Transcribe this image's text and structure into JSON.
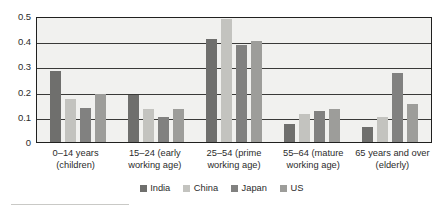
{
  "chart_data": {
    "type": "bar",
    "title": "",
    "xlabel": "",
    "ylabel": "",
    "ylim": [
      0,
      0.5
    ],
    "grid": true,
    "legend_position": "bottom",
    "categories": [
      "0–14 years (children)",
      "15–24 (early working age)",
      "25–54 (prime working age)",
      "55–64 (mature working age)",
      "65 years and over (elderly)"
    ],
    "category_lines": [
      [
        "0–14 years",
        "(children)"
      ],
      [
        "15–24 (early",
        "working age)"
      ],
      [
        "25–54 (prime",
        "working age)"
      ],
      [
        "55–64 (mature",
        "working age)"
      ],
      [
        "65 years and over",
        "(elderly)"
      ]
    ],
    "ytick_labels": [
      "0.5",
      "0.4",
      "0.3",
      "0.2",
      "0.1",
      "0"
    ],
    "ytick_values": [
      0.5,
      0.4,
      0.3,
      0.2,
      0.1,
      0
    ],
    "series": [
      {
        "name": "India",
        "color": "#6f6f6d",
        "values": [
          0.28,
          0.185,
          0.41,
          0.07,
          0.058
        ]
      },
      {
        "name": "China",
        "color": "#c3c3bf",
        "values": [
          0.17,
          0.131,
          0.49,
          0.11,
          0.1
        ]
      },
      {
        "name": "Japan",
        "color": "#818180",
        "values": [
          0.134,
          0.1,
          0.384,
          0.123,
          0.275
        ]
      },
      {
        "name": "US",
        "color": "#9d9d9a",
        "values": [
          0.19,
          0.131,
          0.4,
          0.132,
          0.15
        ]
      }
    ]
  },
  "legend": {
    "items": [
      {
        "label": "India",
        "color": "#6f6f6d"
      },
      {
        "label": "China",
        "color": "#c3c3bf"
      },
      {
        "label": "Japan",
        "color": "#818180"
      },
      {
        "label": "US",
        "color": "#9d9d9a"
      }
    ]
  },
  "colors": {
    "plot_background": "#f1f1ef",
    "axis": "#20201f",
    "gridline": "#3a3a38",
    "text": "#2b2b2b",
    "footnote_rule": "#c9c9c6"
  }
}
